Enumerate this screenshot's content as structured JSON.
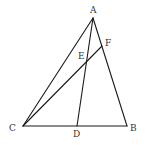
{
  "diagram": {
    "type": "geometry-triangle",
    "points": {
      "A": {
        "x": 93,
        "y": 18,
        "label": "A",
        "lx": 90,
        "ly": 13
      },
      "B": {
        "x": 127,
        "y": 126,
        "label": "B",
        "lx": 130,
        "ly": 131
      },
      "C": {
        "x": 23,
        "y": 126,
        "label": "C",
        "lx": 9,
        "ly": 131
      },
      "D": {
        "x": 77,
        "y": 126,
        "label": "D",
        "lx": 73,
        "ly": 137
      },
      "E": {
        "x": 86,
        "y": 61,
        "label": "E",
        "lx": 78,
        "ly": 59
      },
      "F": {
        "x": 102,
        "y": 46,
        "label": "F",
        "lx": 105,
        "ly": 46
      }
    },
    "segments": [
      {
        "name": "AB",
        "from": "A",
        "to": "B"
      },
      {
        "name": "AC",
        "from": "A",
        "to": "C"
      },
      {
        "name": "CB",
        "from": "C",
        "to": "B"
      },
      {
        "name": "AD",
        "from": "A",
        "to": "D"
      },
      {
        "name": "CF",
        "from": "C",
        "to": "F"
      }
    ],
    "stroke_color": "#1a1a1a",
    "label_color": "#333333"
  }
}
